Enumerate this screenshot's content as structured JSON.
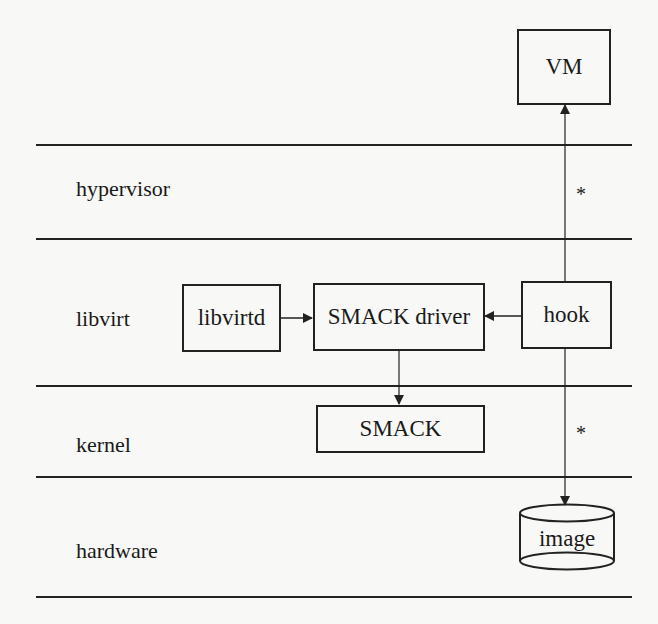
{
  "diagram": {
    "layers": [
      {
        "id": "hypervisor",
        "label": "hypervisor"
      },
      {
        "id": "libvirt",
        "label": "libvirt"
      },
      {
        "id": "kernel",
        "label": "kernel"
      },
      {
        "id": "hardware",
        "label": "hardware"
      }
    ],
    "nodes": {
      "vm": {
        "label": "VM"
      },
      "libvirtd": {
        "label": "libvirtd"
      },
      "smack_driver": {
        "label": "SMACK driver"
      },
      "hook": {
        "label": "hook"
      },
      "smack": {
        "label": "SMACK"
      },
      "image": {
        "label": "image",
        "shape": "cylinder"
      }
    },
    "edges": [
      {
        "from": "libvirtd",
        "to": "smack_driver"
      },
      {
        "from": "hook",
        "to": "smack_driver"
      },
      {
        "from": "smack_driver",
        "to": "smack"
      },
      {
        "from": "hook",
        "to": "vm",
        "label": "*"
      },
      {
        "from": "hook",
        "to": "image",
        "label": "*"
      }
    ],
    "annotations": {
      "star_upper": "*",
      "star_lower": "*"
    },
    "colors": {
      "line": "#222222",
      "background": "#f8f8f6"
    }
  }
}
